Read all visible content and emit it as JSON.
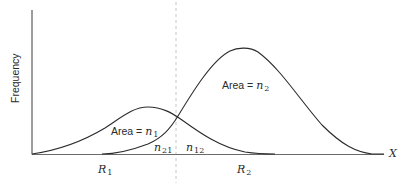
{
  "diagram": {
    "y_axis_label": "Frequency",
    "x_axis_label": "X",
    "curve1_label": {
      "prefix": "Area = ",
      "var": "n",
      "sub": "1"
    },
    "curve2_label": {
      "prefix": "Area = ",
      "var": "n",
      "sub": "2"
    },
    "overlap_left": {
      "var": "n",
      "sub": "21"
    },
    "overlap_right": {
      "var": "n",
      "sub": "12"
    },
    "region1": {
      "var": "R",
      "sub": "1"
    },
    "region2": {
      "var": "R",
      "sub": "2"
    },
    "colors": {
      "curve": "#2b2b2b",
      "axis": "#3a3a3a",
      "divider": "#b0b0b0"
    }
  }
}
